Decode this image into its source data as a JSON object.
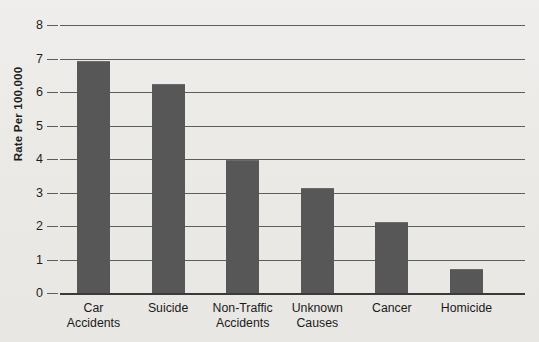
{
  "chart_data": {
    "type": "bar",
    "title": "",
    "xlabel": "",
    "ylabel": "Rate Per 100,000",
    "ylim": [
      0,
      8
    ],
    "ytick_labels": [
      "8",
      "7",
      "6",
      "5",
      "4",
      "3",
      "2",
      "1",
      "0"
    ],
    "yticks": [
      8,
      7,
      6,
      5,
      4,
      3,
      2,
      1,
      0
    ],
    "grid": true,
    "legend": false,
    "bar_color": "#575757",
    "background_color": "#edece9",
    "gridline_color": "#5d5d5d",
    "categories": [
      "Car Accidents",
      "Suicide",
      "Non-Traffic Accidents",
      "Unknown Causes",
      "Cancer",
      "Homicide"
    ],
    "category_lines": [
      [
        "Car",
        "Accidents"
      ],
      [
        "Suicide",
        ""
      ],
      [
        "Non-Traffic",
        "Accidents"
      ],
      [
        "Unknown",
        "Causes"
      ],
      [
        "Cancer",
        ""
      ],
      [
        "Homicide",
        ""
      ]
    ],
    "values": [
      6.9,
      6.2,
      3.95,
      3.1,
      2.1,
      0.7
    ]
  }
}
